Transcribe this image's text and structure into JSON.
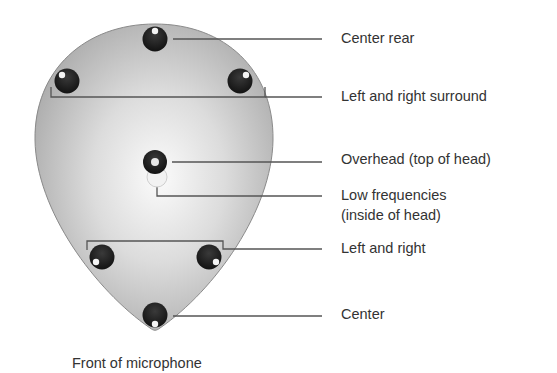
{
  "diagram": {
    "caption": "Front of microphone",
    "colors": {
      "body_gradient_center": "#fafafa",
      "body_gradient_edge": "#a8a8a8",
      "body_outline": "#8a8a8a",
      "capsule": "#222222",
      "leader_line": "#444444",
      "text": "#333333"
    },
    "labels": [
      {
        "id": "center-rear",
        "text": "Center rear"
      },
      {
        "id": "left-right-surround",
        "text": "Left and right surround"
      },
      {
        "id": "overhead",
        "text": "Overhead (top of head)"
      },
      {
        "id": "low-frequencies",
        "text": "Low frequencies",
        "text2": "(inside of head)"
      },
      {
        "id": "left-right",
        "text": "Left and right"
      },
      {
        "id": "center",
        "text": "Center"
      }
    ]
  }
}
